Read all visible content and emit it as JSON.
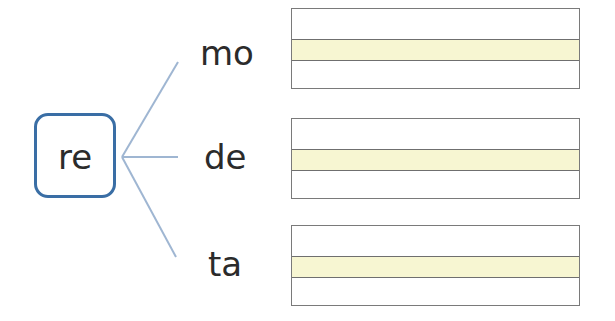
{
  "root": {
    "label": "re"
  },
  "branches": [
    {
      "syllable": "mo"
    },
    {
      "syllable": "de"
    },
    {
      "syllable": "ta"
    }
  ],
  "colors": {
    "root_border": "#3a6ea5",
    "branch_line": "#9fb6d2",
    "write_band": "#f7f6d2",
    "write_border": "#7a7a7a"
  }
}
